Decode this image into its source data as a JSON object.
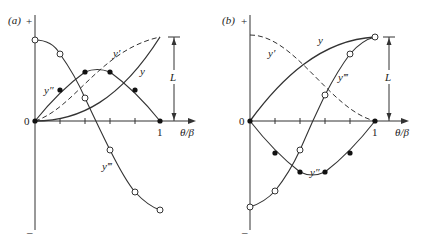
{
  "panels": [
    {
      "id": "a",
      "label": "(a)",
      "axis": {
        "plus": "+",
        "minus": "–",
        "zero": "0",
        "one": "1",
        "xlabel": "θ/β"
      },
      "dimension_label": "L",
      "curves": {
        "y": "y",
        "y1": "y′",
        "y2": "y″",
        "y3": "y‴"
      }
    },
    {
      "id": "b",
      "label": "(b)",
      "axis": {
        "plus": "+",
        "minus": "–",
        "zero": "0",
        "one": "1",
        "xlabel": "θ/β"
      },
      "dimension_label": "L",
      "curves": {
        "y": "y",
        "y1": "y′",
        "y2": "y″",
        "y3": "y‴"
      }
    }
  ],
  "colors": {
    "line": "#333333",
    "background": "#ffffff"
  }
}
